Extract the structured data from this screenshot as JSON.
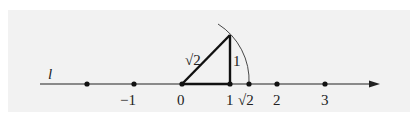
{
  "figure": {
    "line_label": "l",
    "hypotenuse_label": "√2",
    "side_label": "1",
    "tick_labels": [
      {
        "text": "−1",
        "value": -1
      },
      {
        "text": "0",
        "value": 0
      },
      {
        "text": "1",
        "value": 1
      },
      {
        "text": "√2",
        "value": 1.414
      },
      {
        "text": "2",
        "value": 2
      },
      {
        "text": "3",
        "value": 3
      }
    ],
    "points": [
      -2,
      -1,
      0,
      1,
      1.414,
      2,
      3
    ],
    "colors": {
      "background": "#f2f2f2",
      "ink": "#111111"
    }
  }
}
